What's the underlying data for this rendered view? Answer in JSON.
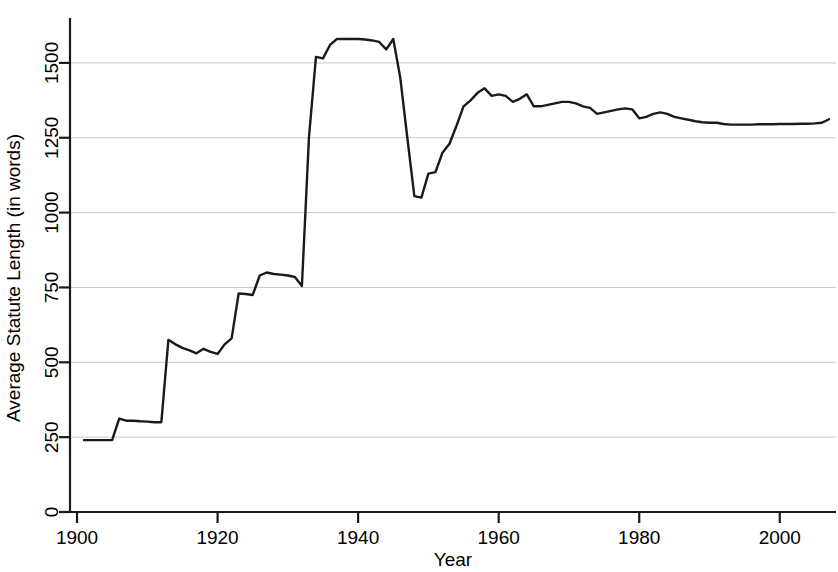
{
  "chart_data": {
    "type": "line",
    "title": "",
    "xlabel": "Year",
    "ylabel": "Average Statute Length (in words)",
    "xlim": [
      1899,
      2008
    ],
    "ylim": [
      0,
      1650
    ],
    "xticks": [
      1900,
      1920,
      1940,
      1960,
      1980,
      2000
    ],
    "xtick_labels": [
      "1900",
      "1920",
      "1940",
      "1960",
      "1980",
      "2000"
    ],
    "yticks": [
      0,
      250,
      500,
      750,
      1000,
      1250,
      1500
    ],
    "ytick_labels": [
      "0",
      "250",
      "500",
      "750",
      "1000",
      "1250",
      "1500"
    ],
    "grid": true,
    "grid_axis": "y",
    "grid_color": "#c8c8c8",
    "line_color": "#1a1a1a",
    "line_width": 2.4,
    "legend": false,
    "series": [
      {
        "name": "Average Statute Length",
        "x": [
          1901,
          1902,
          1903,
          1904,
          1905,
          1906,
          1907,
          1908,
          1909,
          1910,
          1911,
          1912,
          1913,
          1914,
          1915,
          1916,
          1917,
          1918,
          1919,
          1920,
          1921,
          1922,
          1923,
          1924,
          1925,
          1926,
          1927,
          1928,
          1929,
          1930,
          1931,
          1932,
          1933,
          1934,
          1935,
          1936,
          1937,
          1938,
          1939,
          1940,
          1941,
          1942,
          1943,
          1944,
          1945,
          1946,
          1947,
          1948,
          1949,
          1950,
          1951,
          1952,
          1953,
          1954,
          1955,
          1956,
          1957,
          1958,
          1959,
          1960,
          1961,
          1962,
          1963,
          1964,
          1965,
          1966,
          1967,
          1968,
          1969,
          1970,
          1971,
          1972,
          1973,
          1974,
          1975,
          1976,
          1977,
          1978,
          1979,
          1980,
          1981,
          1982,
          1983,
          1984,
          1985,
          1986,
          1987,
          1988,
          1989,
          1990,
          1991,
          1992,
          1993,
          1994,
          1995,
          1996,
          1997,
          1998,
          1999,
          2000,
          2001,
          2002,
          2003,
          2004,
          2005,
          2006,
          2007
        ],
        "values": [
          240,
          240,
          240,
          240,
          240,
          312,
          305,
          305,
          303,
          302,
          300,
          300,
          575,
          560,
          548,
          540,
          530,
          545,
          535,
          528,
          560,
          580,
          730,
          728,
          725,
          790,
          800,
          795,
          793,
          790,
          785,
          755,
          1250,
          1520,
          1515,
          1560,
          1580,
          1580,
          1580,
          1580,
          1578,
          1575,
          1570,
          1545,
          1580,
          1450,
          1250,
          1055,
          1050,
          1130,
          1135,
          1200,
          1230,
          1290,
          1355,
          1375,
          1400,
          1415,
          1390,
          1395,
          1390,
          1370,
          1380,
          1395,
          1355,
          1355,
          1360,
          1365,
          1370,
          1370,
          1365,
          1355,
          1350,
          1330,
          1335,
          1340,
          1345,
          1348,
          1345,
          1315,
          1320,
          1330,
          1335,
          1330,
          1320,
          1315,
          1310,
          1305,
          1302,
          1300,
          1300,
          1296,
          1294,
          1294,
          1294,
          1294,
          1295,
          1295,
          1295,
          1296,
          1296,
          1296,
          1297,
          1297,
          1298,
          1300,
          1312
        ]
      }
    ]
  }
}
